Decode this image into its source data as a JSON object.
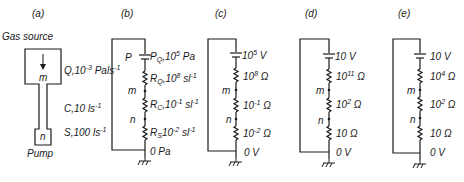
{
  "panel_a": {
    "label": "(a)",
    "title": "Gas source",
    "node_m": "m",
    "node_n": "n",
    "pump": "Pump",
    "q_label": "Q,10",
    "q_exp": "-3",
    "q_unit": " Pals",
    "q_unit_exp": "-1",
    "c_label": "C,10 ls",
    "c_exp": "-1",
    "s_label": "S,100 ls",
    "s_exp": "-1"
  },
  "panel_b": {
    "label": "(b)",
    "node_p": "P",
    "node_m": "m",
    "node_n": "n",
    "source": {
      "sym": "P",
      "sub": "Q",
      "val": ",10",
      "exp": "5",
      "unit": " Pa"
    },
    "r1": {
      "sym": "R",
      "sub": "Q",
      "val": ",10",
      "exp": "8",
      "unit": " sl",
      "unit_exp": "-1"
    },
    "r2": {
      "sym": "R",
      "sub": "C",
      "val": ",10",
      "exp": "-1",
      "unit": " sl",
      "unit_exp": "-1"
    },
    "r3": {
      "sym": "R",
      "sub": "S",
      "val": "10",
      "exp": "-2",
      "unit": " sl",
      "unit_exp": "-1"
    },
    "ground": "0 Pa"
  },
  "panel_c": {
    "label": "(c)",
    "node_m": "m",
    "node_n": "n",
    "source": {
      "val": "10",
      "exp": "5",
      "unit": " V"
    },
    "r1": {
      "val": "10",
      "exp": "8",
      "unit": " Ω"
    },
    "r2": {
      "val": "10",
      "exp": "-1",
      "unit": " Ω"
    },
    "r3": {
      "val": "10",
      "exp": "-2",
      "unit": " Ω"
    },
    "ground": "0 V"
  },
  "panel_d": {
    "label": "(d)",
    "node_m": "m",
    "node_n": "n",
    "source": {
      "val": "10 V"
    },
    "r1": {
      "val": "10",
      "exp": "11",
      "unit": " Ω"
    },
    "r2": {
      "val": "10",
      "exp": "2",
      "unit": " Ω"
    },
    "r3": {
      "val": "10 Ω"
    },
    "ground": "0 V"
  },
  "panel_e": {
    "label": "(e)",
    "node_m": "m",
    "node_n": "n",
    "source": {
      "val": "10 V"
    },
    "r1": {
      "val": "10",
      "exp": "4",
      "unit": " Ω"
    },
    "r2": {
      "val": "10",
      "exp": "2",
      "unit": " Ω"
    },
    "r3": {
      "val": "10 Ω"
    },
    "ground": "0 V"
  },
  "colors": {
    "ink": "#1a1a1a",
    "background": "#ffffff"
  }
}
